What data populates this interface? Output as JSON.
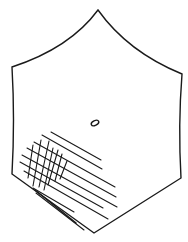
{
  "figure": {
    "type": "crystal-face-line-drawing",
    "shape": "hexagon",
    "stroke_color": "#1a1a1a",
    "background_color": "#ffffff",
    "vertices": {
      "top": [
        98,
        10
      ],
      "upper_left": [
        12,
        67
      ],
      "upper_right": [
        182,
        74
      ],
      "lower_left": [
        12,
        174
      ],
      "lower_right": [
        181,
        178
      ],
      "bottom": [
        94,
        233
      ]
    },
    "features": [
      {
        "name": "central-oval-mark",
        "cx": 95,
        "cy": 123,
        "rx": 4,
        "ry": 2.5
      },
      {
        "name": "cross-hatched-region",
        "location": "lower-left"
      },
      {
        "name": "parallel-striations",
        "location": "lower-left toward bottom edge"
      }
    ]
  }
}
